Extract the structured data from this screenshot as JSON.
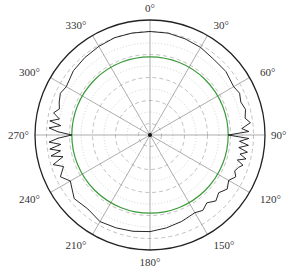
{
  "chart_data": {
    "type": "polar-line",
    "title": "",
    "angular_ticks": [
      "0°",
      "30°",
      "60°",
      "90°",
      "120°",
      "150°",
      "180°",
      "210°",
      "240°",
      "270°",
      "300°",
      "330°"
    ],
    "angular_tick_degrees": [
      0,
      30,
      60,
      90,
      120,
      150,
      180,
      210,
      240,
      270,
      300,
      330
    ],
    "direction": "clockwise",
    "zero_location": "top",
    "radial_range": [
      0,
      1
    ],
    "radial_rings": [
      0.1,
      0.2,
      0.3,
      0.4,
      0.5,
      0.6,
      0.7,
      0.8,
      0.9,
      1.0
    ],
    "reference_circle": {
      "r": 0.68,
      "color": "#3a9a3a"
    },
    "grid": true,
    "series": [
      {
        "name": "measured pattern",
        "color": "#111111",
        "theta_deg": [
          0,
          10,
          20,
          30,
          40,
          50,
          60,
          65,
          70,
          75,
          80,
          83,
          86,
          88,
          90,
          92,
          94,
          96,
          98,
          100,
          102,
          104,
          106,
          108,
          110,
          113,
          116,
          120,
          125,
          130,
          135,
          140,
          145,
          150,
          160,
          170,
          180,
          190,
          200,
          210,
          220,
          230,
          240,
          245,
          250,
          253,
          256,
          258,
          260,
          262,
          264,
          266,
          268,
          270,
          272,
          274,
          276,
          278,
          280,
          283,
          286,
          290,
          295,
          300,
          310,
          320,
          330,
          340,
          350,
          360
        ],
        "r": [
          0.9,
          0.9,
          0.89,
          0.88,
          0.86,
          0.86,
          0.84,
          0.86,
          0.84,
          0.86,
          0.84,
          0.88,
          0.8,
          0.86,
          0.68,
          0.86,
          0.78,
          0.86,
          0.78,
          0.86,
          0.8,
          0.86,
          0.79,
          0.85,
          0.82,
          0.8,
          0.83,
          0.79,
          0.82,
          0.78,
          0.81,
          0.77,
          0.8,
          0.78,
          0.8,
          0.82,
          0.84,
          0.85,
          0.86,
          0.87,
          0.84,
          0.86,
          0.8,
          0.86,
          0.8,
          0.88,
          0.78,
          0.88,
          0.79,
          0.88,
          0.78,
          0.88,
          0.8,
          0.68,
          0.8,
          0.88,
          0.78,
          0.88,
          0.8,
          0.86,
          0.82,
          0.84,
          0.86,
          0.84,
          0.87,
          0.88,
          0.89,
          0.9,
          0.9,
          0.9
        ]
      }
    ],
    "legend": null
  },
  "layout": {
    "center": [
      150,
      135
    ],
    "radius": 115,
    "label_offset": 12
  }
}
